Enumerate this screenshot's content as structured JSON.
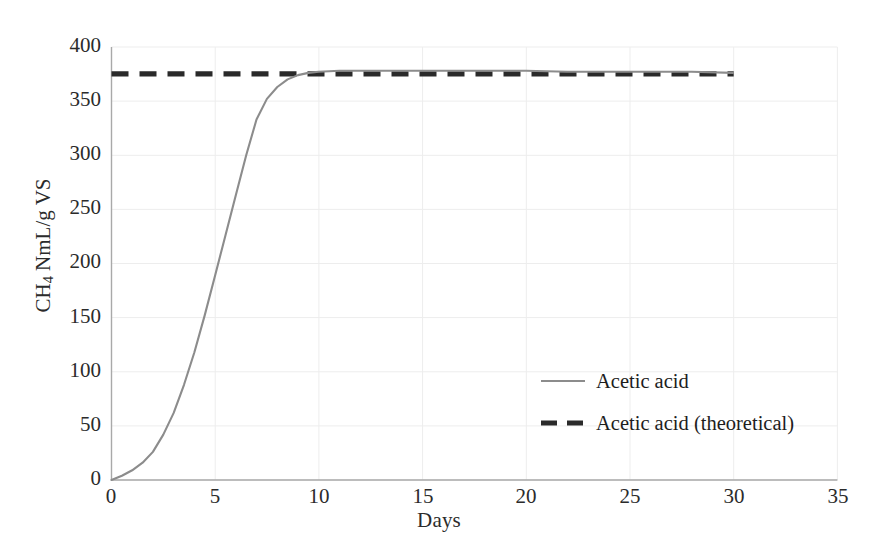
{
  "chart_data": {
    "type": "line",
    "title": "",
    "xlabel": "Days",
    "ylabel_html": "CH<sub>4</sub> NmL/g VS",
    "ylabel_text": "CH4 NmL/g VS",
    "xlim": [
      0,
      35
    ],
    "ylim": [
      0,
      400
    ],
    "xticks": [
      "0",
      "5",
      "10",
      "15",
      "20",
      "25",
      "30",
      "35"
    ],
    "yticks": [
      "0",
      "50",
      "100",
      "150",
      "200",
      "250",
      "300",
      "350",
      "400"
    ],
    "grid": true,
    "legend_position": "center-right",
    "series": [
      {
        "name": "Acetic acid",
        "style": "solid",
        "color": "#8c8c8c",
        "x": [
          0,
          0.5,
          1,
          1.5,
          2,
          2.5,
          3,
          3.5,
          4,
          4.5,
          5,
          5.5,
          6,
          6.5,
          7,
          7.5,
          8,
          8.5,
          9,
          9.5,
          10,
          11,
          12,
          13,
          14,
          15,
          16,
          17,
          18,
          19,
          20,
          22,
          24,
          26,
          28,
          30
        ],
        "y": [
          0,
          4,
          9,
          16,
          26,
          42,
          62,
          88,
          118,
          152,
          189,
          226,
          263,
          300,
          333,
          352,
          363,
          370,
          374,
          376,
          377,
          378,
          378,
          378,
          378,
          378,
          378,
          378,
          378,
          378,
          378,
          377,
          377,
          377,
          377,
          376
        ]
      },
      {
        "name": "Acetic acid (theoretical)",
        "style": "dashed",
        "color": "#2a2a2a",
        "x": [
          0,
          30
        ],
        "y": [
          375,
          375
        ]
      }
    ]
  },
  "legend": {
    "items": [
      {
        "label": "Acetic acid",
        "style": "solid",
        "color": "#8c8c8c"
      },
      {
        "label": "Acetic acid (theoretical)",
        "style": "dashed",
        "color": "#2a2a2a"
      }
    ]
  },
  "axes": {
    "x": {
      "label": "Days",
      "ticks": [
        "0",
        "5",
        "10",
        "15",
        "20",
        "25",
        "30",
        "35"
      ]
    },
    "y": {
      "label": "CH4 NmL/g VS",
      "ticks": [
        "0",
        "50",
        "100",
        "150",
        "200",
        "250",
        "300",
        "350",
        "400"
      ]
    }
  },
  "colors": {
    "series_solid": "#8c8c8c",
    "series_dashed": "#2a2a2a",
    "axis": "#b0b0b0",
    "grid": "#eaeaea",
    "text": "#2b2b2b",
    "background": "#ffffff"
  }
}
